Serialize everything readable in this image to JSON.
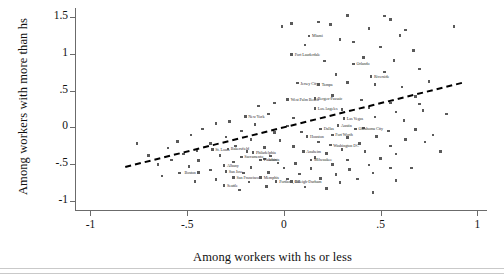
{
  "figure": {
    "kind": "scatter",
    "x_axis_title": "Among workers with hs or less",
    "y_axis_title": "Among workers with more than hs"
  },
  "chart_data": {
    "type": "scatter",
    "title": "",
    "xlabel": "Among workers with hs or less",
    "ylabel": "Among workers with more than hs",
    "xlim": [
      -1.08,
      1.05
    ],
    "ylim": [
      -1.12,
      1.62
    ],
    "xticks": [
      "-1",
      "-.5",
      "0",
      ".5",
      "1"
    ],
    "xtickvals": [
      -1,
      -0.5,
      0,
      0.5,
      1
    ],
    "yticks": [
      "1.5",
      "1",
      ".5",
      "0",
      "-.5",
      "-1"
    ],
    "ytickvals": [
      1.5,
      1,
      0.5,
      0,
      -0.5,
      -1
    ],
    "grid": false,
    "legend": "none",
    "marker_color": "#5a5a5a",
    "fit_line": {
      "style": "dashed",
      "color": "#000000",
      "x0": -0.82,
      "y0": -0.52,
      "x1": 0.92,
      "y1": 0.62
    },
    "labeled_points": [
      {
        "label": "Miami",
        "x": 0.13,
        "y": 1.24,
        "anchor": "right"
      },
      {
        "label": "Fort Lauderdale",
        "x": 0.04,
        "y": 0.99,
        "anchor": "right"
      },
      {
        "label": "Orlando",
        "x": 0.36,
        "y": 0.86,
        "anchor": "right"
      },
      {
        "label": "Riverside",
        "x": 0.45,
        "y": 0.69,
        "anchor": "right"
      },
      {
        "label": "Jersey City",
        "x": 0.07,
        "y": 0.6,
        "anchor": "right"
      },
      {
        "label": "Tampa",
        "x": 0.18,
        "y": 0.58,
        "anchor": "right"
      },
      {
        "label": "West Palm Beach",
        "x": 0.02,
        "y": 0.38,
        "anchor": "right"
      },
      {
        "label": "Bergen-Passaic",
        "x": 0.16,
        "y": 0.39,
        "anchor": "right"
      },
      {
        "label": "Los Angeles",
        "x": 0.16,
        "y": 0.26,
        "anchor": "right"
      },
      {
        "label": "New York",
        "x": -0.2,
        "y": 0.15,
        "anchor": "right"
      },
      {
        "label": "Las Vegas",
        "x": 0.31,
        "y": 0.12,
        "anchor": "right"
      },
      {
        "label": "Austin",
        "x": 0.28,
        "y": 0.03,
        "anchor": "right"
      },
      {
        "label": "Dallas",
        "x": 0.19,
        "y": -0.02,
        "anchor": "right"
      },
      {
        "label": "Oklahoma City",
        "x": 0.37,
        "y": -0.02,
        "anchor": "right"
      },
      {
        "label": "Fort Worth",
        "x": 0.25,
        "y": -0.1,
        "anchor": "right"
      },
      {
        "label": "Houston",
        "x": 0.12,
        "y": -0.12,
        "anchor": "right"
      },
      {
        "label": "Washington DC",
        "x": 0.24,
        "y": -0.24,
        "anchor": "right"
      },
      {
        "label": "St. Louis",
        "x": -0.37,
        "y": -0.3,
        "anchor": "right"
      },
      {
        "label": "Philadelphia",
        "x": -0.16,
        "y": -0.34,
        "anchor": "right"
      },
      {
        "label": "Anaheim",
        "x": 0.1,
        "y": -0.33,
        "anchor": "right"
      },
      {
        "label": "Sacramento",
        "x": -0.22,
        "y": -0.4,
        "anchor": "right"
      },
      {
        "label": "Bakersfield",
        "x": -0.29,
        "y": -0.29,
        "anchor": "right"
      },
      {
        "label": "Atlanta",
        "x": -0.1,
        "y": -0.43,
        "anchor": "right"
      },
      {
        "label": "Milwaukee",
        "x": 0.14,
        "y": -0.44,
        "anchor": "right"
      },
      {
        "label": "Phoenix",
        "x": -0.12,
        "y": -0.44,
        "anchor": "right"
      },
      {
        "label": "Albany",
        "x": -0.31,
        "y": -0.52,
        "anchor": "right"
      },
      {
        "label": "Boston",
        "x": -0.44,
        "y": -0.61,
        "anchor": "left"
      },
      {
        "label": "San Jose",
        "x": -0.3,
        "y": -0.6,
        "anchor": "right"
      },
      {
        "label": "San Francisco",
        "x": -0.26,
        "y": -0.68,
        "anchor": "right"
      },
      {
        "label": "Memphis",
        "x": -0.12,
        "y": -0.68,
        "anchor": "right"
      },
      {
        "label": "Portland, OR",
        "x": -0.04,
        "y": -0.73,
        "anchor": "right"
      },
      {
        "label": "Raleigh-Durham",
        "x": 0.04,
        "y": -0.73,
        "anchor": "right"
      },
      {
        "label": "Seattle",
        "x": -0.31,
        "y": -0.79,
        "anchor": "right"
      }
    ],
    "points": [
      [
        0.13,
        1.24
      ],
      [
        0.04,
        0.99
      ],
      [
        0.36,
        0.86
      ],
      [
        0.45,
        0.69
      ],
      [
        0.88,
        1.37
      ],
      [
        0.33,
        1.52
      ],
      [
        0.52,
        1.51
      ],
      [
        0.55,
        1.46
      ],
      [
        0.24,
        1.4
      ],
      [
        0.18,
        1.43
      ],
      [
        0.04,
        1.41
      ],
      [
        -0.01,
        1.37
      ],
      [
        0.44,
        1.34
      ],
      [
        0.63,
        1.32
      ],
      [
        0.6,
        1.25
      ],
      [
        0.36,
        1.16
      ],
      [
        0.29,
        1.19
      ],
      [
        0.11,
        1.12
      ],
      [
        0.5,
        1.09
      ],
      [
        0.67,
        1.04
      ],
      [
        0.41,
        0.95
      ],
      [
        0.57,
        0.91
      ],
      [
        0.21,
        0.9
      ],
      [
        0.7,
        0.79
      ],
      [
        0.52,
        0.75
      ],
      [
        0.27,
        0.72
      ],
      [
        0.07,
        0.6
      ],
      [
        0.18,
        0.58
      ],
      [
        0.33,
        0.61
      ],
      [
        0.47,
        0.58
      ],
      [
        0.61,
        0.55
      ],
      [
        0.75,
        0.62
      ],
      [
        0.02,
        0.38
      ],
      [
        0.16,
        0.39
      ],
      [
        0.25,
        0.43
      ],
      [
        0.4,
        0.37
      ],
      [
        0.55,
        0.33
      ],
      [
        0.68,
        0.42
      ],
      [
        -0.05,
        0.33
      ],
      [
        -0.13,
        0.29
      ],
      [
        0.16,
        0.26
      ],
      [
        0.3,
        0.24
      ],
      [
        0.44,
        0.27
      ],
      [
        0.58,
        0.21
      ],
      [
        0.72,
        0.23
      ],
      [
        -0.2,
        0.15
      ],
      [
        -0.08,
        0.18
      ],
      [
        0.05,
        0.13
      ],
      [
        0.31,
        0.12
      ],
      [
        0.47,
        0.14
      ],
      [
        0.62,
        0.09
      ],
      [
        -0.28,
        0.08
      ],
      [
        -0.35,
        0.05
      ],
      [
        -0.15,
        0.04
      ],
      [
        0.02,
        0.02
      ],
      [
        0.28,
        0.03
      ],
      [
        0.41,
        -0.01
      ],
      [
        0.19,
        -0.02
      ],
      [
        0.37,
        -0.02
      ],
      [
        0.54,
        -0.05
      ],
      [
        0.68,
        -0.03
      ],
      [
        -0.22,
        -0.05
      ],
      [
        -0.42,
        -0.02
      ],
      [
        -0.05,
        -0.07
      ],
      [
        0.09,
        -0.06
      ],
      [
        0.25,
        -0.1
      ],
      [
        0.12,
        -0.12
      ],
      [
        0.33,
        -0.14
      ],
      [
        0.48,
        -0.12
      ],
      [
        0.63,
        -0.16
      ],
      [
        -0.3,
        -0.13
      ],
      [
        -0.48,
        -0.1
      ],
      [
        -0.17,
        -0.16
      ],
      [
        -0.02,
        -0.18
      ],
      [
        0.18,
        -0.2
      ],
      [
        0.24,
        -0.24
      ],
      [
        0.39,
        -0.22
      ],
      [
        0.55,
        -0.25
      ],
      [
        0.73,
        -0.2
      ],
      [
        -0.38,
        -0.22
      ],
      [
        -0.55,
        -0.19
      ],
      [
        -0.25,
        -0.25
      ],
      [
        -0.1,
        -0.27
      ],
      [
        0.05,
        -0.26
      ],
      [
        0.3,
        -0.3
      ],
      [
        -0.37,
        -0.3
      ],
      [
        -0.29,
        -0.29
      ],
      [
        -0.45,
        -0.31
      ],
      [
        -0.6,
        -0.28
      ],
      [
        -0.19,
        -0.33
      ],
      [
        -0.16,
        -0.34
      ],
      [
        0.1,
        -0.33
      ],
      [
        0.22,
        -0.35
      ],
      [
        0.42,
        -0.33
      ],
      [
        0.58,
        -0.36
      ],
      [
        -0.52,
        -0.36
      ],
      [
        -0.33,
        -0.38
      ],
      [
        -0.22,
        -0.4
      ],
      [
        -0.07,
        -0.39
      ],
      [
        0.16,
        -0.41
      ],
      [
        -0.1,
        -0.43
      ],
      [
        0.14,
        -0.44
      ],
      [
        -0.12,
        -0.44
      ],
      [
        0.33,
        -0.44
      ],
      [
        0.5,
        -0.42
      ],
      [
        -0.44,
        -0.45
      ],
      [
        -0.26,
        -0.47
      ],
      [
        -0.58,
        -0.44
      ],
      [
        -0.03,
        -0.48
      ],
      [
        0.06,
        -0.49
      ],
      [
        0.25,
        -0.5
      ],
      [
        0.44,
        -0.51
      ],
      [
        -0.31,
        -0.52
      ],
      [
        -0.49,
        -0.53
      ],
      [
        -0.17,
        -0.54
      ],
      [
        -0.65,
        -0.5
      ],
      [
        0.0,
        -0.55
      ],
      [
        0.14,
        -0.56
      ],
      [
        0.34,
        -0.57
      ],
      [
        0.55,
        -0.55
      ],
      [
        -0.38,
        -0.58
      ],
      [
        -0.3,
        -0.6
      ],
      [
        -0.44,
        -0.61
      ],
      [
        -0.21,
        -0.62
      ],
      [
        -0.08,
        -0.61
      ],
      [
        0.08,
        -0.63
      ],
      [
        0.27,
        -0.64
      ],
      [
        0.46,
        -0.62
      ],
      [
        -0.54,
        -0.62
      ],
      [
        -0.26,
        -0.68
      ],
      [
        -0.12,
        -0.68
      ],
      [
        0.02,
        -0.7
      ],
      [
        0.19,
        -0.69
      ],
      [
        0.38,
        -0.7
      ],
      [
        -0.35,
        -0.71
      ],
      [
        -0.04,
        -0.73
      ],
      [
        0.04,
        -0.73
      ],
      [
        -0.18,
        -0.74
      ],
      [
        0.29,
        -0.75
      ],
      [
        -0.46,
        -0.73
      ],
      [
        -0.31,
        -0.79
      ],
      [
        -0.09,
        -0.8
      ],
      [
        0.11,
        -0.81
      ],
      [
        0.22,
        -0.83
      ],
      [
        -0.23,
        -0.85
      ],
      [
        0.77,
        -0.1
      ],
      [
        0.81,
        -0.33
      ],
      [
        0.66,
        -0.55
      ],
      [
        0.58,
        -0.72
      ],
      [
        0.7,
        0.32
      ],
      [
        0.84,
        0.18
      ],
      [
        0.46,
        -0.88
      ],
      [
        -0.7,
        -0.38
      ],
      [
        -0.76,
        -0.22
      ],
      [
        -0.63,
        -0.66
      ]
    ]
  }
}
